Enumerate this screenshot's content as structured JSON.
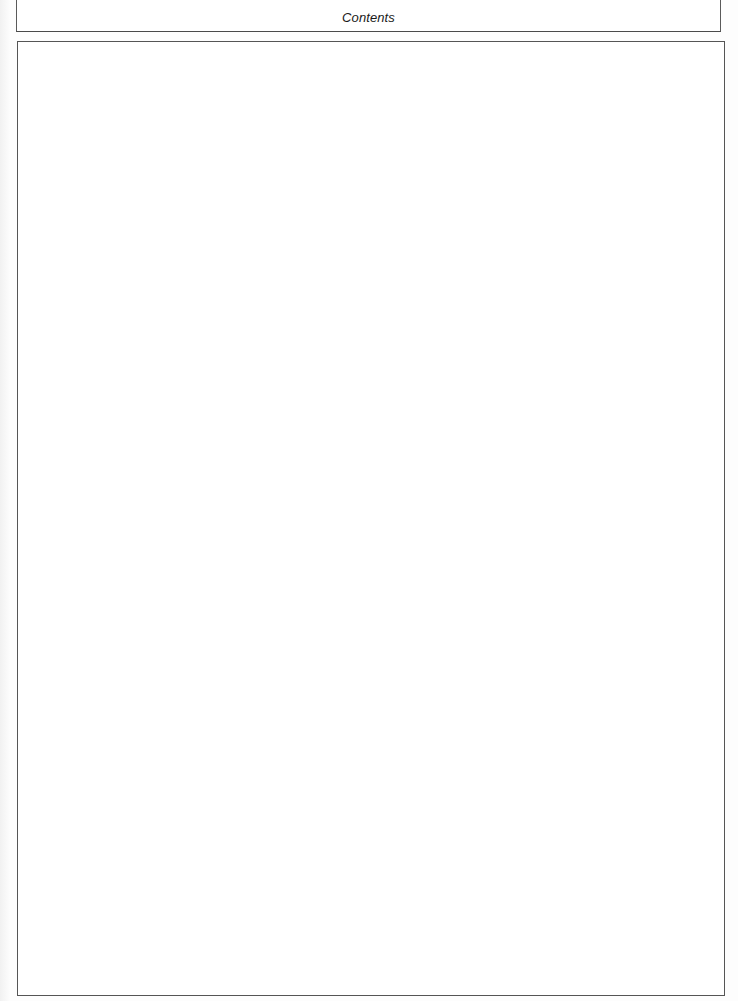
{
  "header": {
    "title": "Contents"
  },
  "content": {
    "body_text": ""
  },
  "colors": {
    "border": "#555555",
    "text": "#1a1a1a",
    "background": "#ffffff"
  }
}
